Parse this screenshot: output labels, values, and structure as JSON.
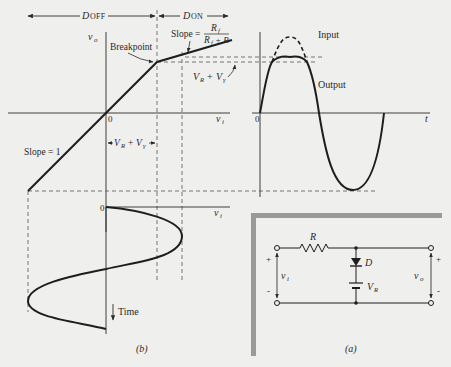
{
  "transfer_characteristic": {
    "region_off_label": "D",
    "region_off_sub": "OFF",
    "region_on_label": "D",
    "region_on_sub": "ON",
    "y_axis_label": "v",
    "y_axis_sub": "o",
    "x_axis_label": "v",
    "x_axis_sub": "i",
    "origin_label": "0",
    "breakpoint_label": "Breakpoint",
    "slope_label": "Slope =",
    "slope_numerator": "R",
    "slope_numerator_sub": "f",
    "slope_denominator_a": "R",
    "slope_denominator_a_sub": "f",
    "slope_denominator_b": "+ R",
    "slope1_label": "Slope = 1",
    "threshold_label_1": "V",
    "threshold_label_1_sub": "R",
    "threshold_plus": "+",
    "threshold_label_2": "V",
    "threshold_label_2_sub": "γ"
  },
  "waveform": {
    "input_label": "Input",
    "output_label": "Output",
    "origin_label": "0",
    "x_axis_label": "t"
  },
  "input_vs_time": {
    "origin_label": "0",
    "x_axis_label": "v",
    "x_axis_sub": "i",
    "time_label": "Time",
    "caption": "(b)"
  },
  "circuit": {
    "resistor_label": "R",
    "diode_label": "D",
    "battery_label": "V",
    "battery_sub": "R",
    "input_label": "v",
    "input_sub": "i",
    "output_label": "v",
    "output_sub": "o",
    "plus": "+",
    "minus": "-",
    "caption": "(a)"
  }
}
